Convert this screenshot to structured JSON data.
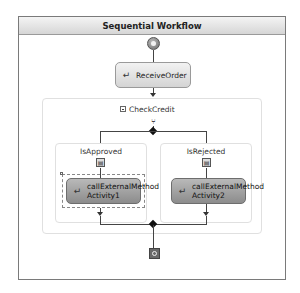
{
  "workflow": {
    "title": "Sequential Workflow",
    "start_icon": "workflow-start-icon",
    "end_icon": "workflow-stop-icon"
  },
  "activities": {
    "receive_order": {
      "label": "ReceiveOrder",
      "icon": "receive-activity-icon"
    }
  },
  "check_credit": {
    "label": "CheckCredit",
    "collapse_icon": "collapse-icon",
    "branch_icon": "ifelse-icon",
    "branches": [
      {
        "label": "IsApproved",
        "condition_icon": "condition-icon",
        "activity": {
          "line1": "callExternalMethod",
          "line2": "Activity1",
          "selected": true
        }
      },
      {
        "label": "IsRejected",
        "condition_icon": "condition-icon",
        "activity": {
          "line1": "callExternalMethod",
          "line2": "Activity2",
          "selected": false
        }
      }
    ]
  },
  "colors": {
    "frame_border": "#7a7a7a",
    "header_bg": "#dcdcdc",
    "activity_light": "#e4e4e4",
    "activity_dark": "#a3a3a3",
    "connector": "#444444"
  }
}
